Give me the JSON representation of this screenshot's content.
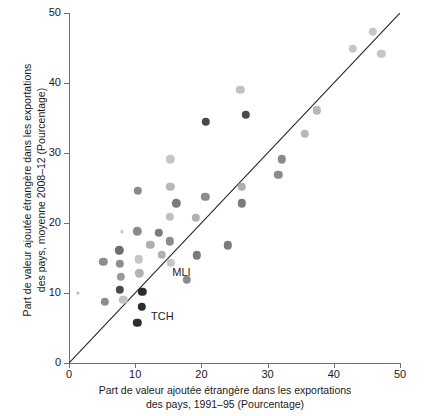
{
  "chart_data": {
    "type": "scatter",
    "title": "",
    "xlabel": "Part de valeur ajoutée étrangère dans les exportations des pays, 1991–95 (Pourcentage)",
    "ylabel": "Part de valeur ajoutée étrangère dans les exportations des pays, moyenne 2008–12 (Pourcentage)",
    "xlabel_line1": "Part de valeur ajoutée étrangère dans les exportations",
    "xlabel_line2": "des pays, 1991–95 (Pourcentage)",
    "ylabel_line1": "Part de valeur ajoutée étrangère dans les exportations",
    "ylabel_line2": "des pays, moyenne 2008–12 (Pourcentage)",
    "xlim": [
      0,
      50
    ],
    "ylim": [
      0,
      50
    ],
    "xticks": [
      0,
      10,
      20,
      30,
      40,
      50
    ],
    "yticks": [
      0,
      10,
      20,
      30,
      40,
      50
    ],
    "xtick_labels": [
      "0",
      "10",
      "20",
      "30",
      "40",
      "50"
    ],
    "ytick_labels": [
      "0",
      "10",
      "20",
      "30",
      "40",
      "50"
    ],
    "grid": false,
    "legend": null,
    "reference_line": {
      "name": "identity-line",
      "from": [
        0,
        0
      ],
      "to": [
        50,
        50
      ],
      "description": "45 degree line y = x"
    },
    "marker_radius_px": 4.2,
    "points": [
      {
        "x": 1.3,
        "y": 10.0,
        "shade": "#b9b9b9",
        "r": 1.6
      },
      {
        "x": 5.2,
        "y": 14.5,
        "shade": "#8d8d8d"
      },
      {
        "x": 5.4,
        "y": 8.7,
        "shade": "#8d8d8d"
      },
      {
        "x": 7.6,
        "y": 16.1,
        "shade": "#6e6e6e"
      },
      {
        "x": 7.7,
        "y": 14.2,
        "shade": "#8d8d8d"
      },
      {
        "x": 7.8,
        "y": 12.3,
        "shade": "#9a9a9a"
      },
      {
        "x": 7.7,
        "y": 10.5,
        "shade": "#4a4a4a"
      },
      {
        "x": 8.2,
        "y": 9.0,
        "shade": "#c2c2c2"
      },
      {
        "x": 8.0,
        "y": 18.8,
        "shade": "#c9c9c9",
        "r": 1.6
      },
      {
        "x": 10.4,
        "y": 24.6,
        "shade": "#8b8b8b"
      },
      {
        "x": 10.3,
        "y": 18.8,
        "shade": "#8b8b8b"
      },
      {
        "x": 10.5,
        "y": 14.8,
        "shade": "#c6c6c6"
      },
      {
        "x": 10.6,
        "y": 12.8,
        "shade": "#b3b3b3"
      },
      {
        "x": 10.3,
        "y": 5.7,
        "shade": "#2d2d2d"
      },
      {
        "x": 11.1,
        "y": 10.2,
        "shade": "#2d2d2d"
      },
      {
        "x": 11.0,
        "y": 8.0,
        "shade": "#2d2d2d"
      },
      {
        "x": 12.3,
        "y": 16.9,
        "shade": "#b0b0b0"
      },
      {
        "x": 13.6,
        "y": 18.6,
        "shade": "#7b7b7b"
      },
      {
        "x": 14.0,
        "y": 15.5,
        "shade": "#b0b0b0"
      },
      {
        "x": 15.3,
        "y": 29.1,
        "shade": "#c6c6c6"
      },
      {
        "x": 15.3,
        "y": 25.2,
        "shade": "#b8b8b8"
      },
      {
        "x": 15.2,
        "y": 20.9,
        "shade": "#c0c0c0"
      },
      {
        "x": 15.2,
        "y": 17.4,
        "shade": "#8b8b8b"
      },
      {
        "x": 15.4,
        "y": 14.3,
        "shade": "#c6c6c6"
      },
      {
        "x": 16.2,
        "y": 22.8,
        "shade": "#7b7b7b"
      },
      {
        "x": 17.8,
        "y": 11.9,
        "shade": "#8b8b8b"
      },
      {
        "x": 19.2,
        "y": 20.7,
        "shade": "#b0b0b0"
      },
      {
        "x": 19.3,
        "y": 15.4,
        "shade": "#7b7b7b"
      },
      {
        "x": 20.6,
        "y": 23.7,
        "shade": "#8b8b8b"
      },
      {
        "x": 20.7,
        "y": 34.5,
        "shade": "#4a4a4a"
      },
      {
        "x": 24.0,
        "y": 16.8,
        "shade": "#7b7b7b"
      },
      {
        "x": 25.9,
        "y": 39.0,
        "shade": "#c2c2c2"
      },
      {
        "x": 26.1,
        "y": 25.2,
        "shade": "#b0b0b0"
      },
      {
        "x": 26.1,
        "y": 22.8,
        "shade": "#7b7b7b"
      },
      {
        "x": 26.7,
        "y": 35.5,
        "shade": "#4a4a4a"
      },
      {
        "x": 31.6,
        "y": 26.9,
        "shade": "#8b8b8b"
      },
      {
        "x": 32.1,
        "y": 29.1,
        "shade": "#8b8b8b"
      },
      {
        "x": 35.6,
        "y": 32.7,
        "shade": "#b8b8b8"
      },
      {
        "x": 37.4,
        "y": 36.1,
        "shade": "#b8b8b8"
      },
      {
        "x": 42.9,
        "y": 44.9,
        "shade": "#c6c6c6"
      },
      {
        "x": 45.9,
        "y": 47.3,
        "shade": "#c6c6c6"
      },
      {
        "x": 47.2,
        "y": 44.2,
        "shade": "#c6c6c6"
      }
    ],
    "annotations": [
      {
        "label": "MLI",
        "x": 15.6,
        "y": 12.9
      },
      {
        "label": "TCH",
        "x": 12.4,
        "y": 6.6
      }
    ]
  }
}
